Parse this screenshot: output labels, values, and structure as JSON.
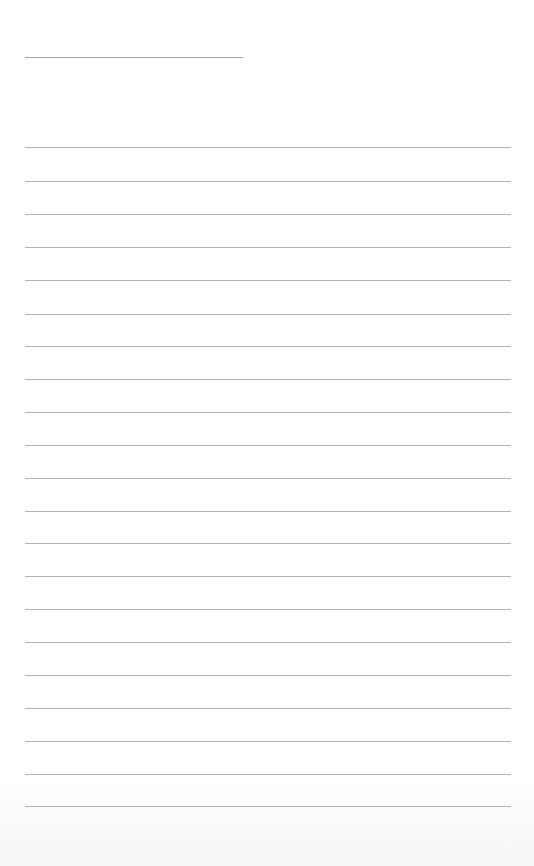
{
  "page": {
    "type": "blank lined paper",
    "title_line": {
      "x": 25,
      "y": 57,
      "width": 218
    },
    "rule_lines": {
      "x": 25,
      "width": 486,
      "y_positions": [
        147,
        181,
        214,
        247,
        280,
        314,
        346,
        379,
        412,
        445,
        478,
        511,
        543,
        576,
        609,
        642,
        675,
        708,
        741,
        774,
        806
      ]
    },
    "line_color": "#9a9a9a",
    "background_color": "#ffffff"
  }
}
